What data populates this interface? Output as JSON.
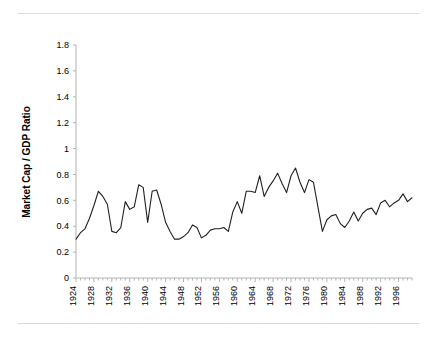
{
  "chart_data": {
    "type": "line",
    "title": "",
    "subtitle": "",
    "xlabel": "",
    "ylabel": "Market Cap / GDP Ratio",
    "xlim": [
      1924,
      1999
    ],
    "ylim": [
      0,
      1.8
    ],
    "grid": false,
    "legend": null,
    "legend_position": "none",
    "series_color": "#231f20",
    "y_ticks": [
      "0",
      "0.2",
      "0.4",
      "0.6",
      "0.8",
      "1",
      "1.2",
      "1.4",
      "1.6",
      "1.8"
    ],
    "y_tick_values": [
      0,
      0.2,
      0.4,
      0.6,
      0.8,
      1,
      1.2,
      1.4,
      1.6,
      1.8
    ],
    "x_ticks": [
      "1924",
      "1928",
      "1932",
      "1936",
      "1940",
      "1944",
      "1948",
      "1952",
      "1956",
      "1960",
      "1964",
      "1968",
      "1972",
      "1976",
      "1980",
      "1984",
      "1988",
      "1992",
      "1996"
    ],
    "x_tick_values": [
      1924,
      1928,
      1932,
      1936,
      1940,
      1944,
      1948,
      1952,
      1956,
      1960,
      1964,
      1968,
      1972,
      1976,
      1980,
      1984,
      1988,
      1992,
      1996
    ],
    "x_minor_tick_step": 1,
    "series": [
      {
        "name": "Market Cap / GDP Ratio",
        "x": [
          1924,
          1925,
          1926,
          1927,
          1928,
          1929,
          1930,
          1931,
          1932,
          1933,
          1934,
          1935,
          1936,
          1937,
          1938,
          1939,
          1940,
          1941,
          1942,
          1943,
          1944,
          1945,
          1946,
          1947,
          1948,
          1949,
          1950,
          1951,
          1952,
          1953,
          1954,
          1955,
          1956,
          1957,
          1958,
          1959,
          1960,
          1961,
          1962,
          1963,
          1964,
          1965,
          1966,
          1967,
          1968,
          1969,
          1970,
          1971,
          1972,
          1973,
          1974,
          1975,
          1976,
          1977,
          1978,
          1979,
          1980,
          1981,
          1982,
          1983,
          1984,
          1985,
          1986,
          1987,
          1988,
          1989,
          1990,
          1991,
          1992,
          1993,
          1994,
          1995,
          1996,
          1997,
          1998,
          1999
        ],
        "values": [
          0.3,
          0.35,
          0.38,
          0.46,
          0.56,
          0.67,
          0.63,
          0.57,
          0.36,
          0.35,
          0.39,
          0.59,
          0.53,
          0.55,
          0.72,
          0.7,
          0.43,
          0.67,
          0.68,
          0.57,
          0.43,
          0.36,
          0.3,
          0.3,
          0.32,
          0.35,
          0.41,
          0.39,
          0.31,
          0.33,
          0.37,
          0.38,
          0.38,
          0.39,
          0.36,
          0.51,
          0.59,
          0.5,
          0.67,
          0.67,
          0.66,
          0.79,
          0.63,
          0.7,
          0.75,
          0.81,
          0.73,
          0.66,
          0.79,
          0.85,
          0.74,
          0.66,
          0.76,
          0.74,
          0.55,
          0.36,
          0.45,
          0.48,
          0.49,
          0.42,
          0.39,
          0.44,
          0.51,
          0.44,
          0.5,
          0.53,
          0.54,
          0.49,
          0.58,
          0.6,
          0.55,
          0.58,
          0.6,
          0.65,
          0.59,
          0.62
        ]
      }
    ]
  },
  "chart_detail_points": {
    "note": "Interpolated yearly line, 1924–1999, peaking near 1.7 at the right edge",
    "max_value": 1.7,
    "min_value": 0.3
  }
}
